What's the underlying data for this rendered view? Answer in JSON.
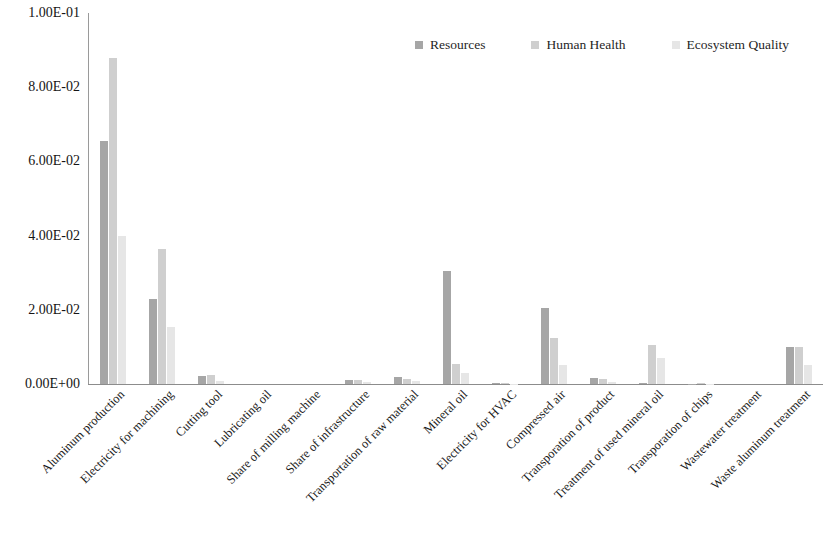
{
  "chart_data": {
    "type": "bar",
    "title": "",
    "subtitle": "",
    "xlabel": "",
    "ylabel": "",
    "ylim": [
      0,
      0.1
    ],
    "grid": false,
    "legend_position": "top-right",
    "orientation": "vertical-grouped",
    "ytick_labels": [
      "1.00E-01",
      "8.00E-02",
      "6.00E-02",
      "4.00E-02",
      "2.00E-02",
      "0.00E+00"
    ],
    "ytick_values": [
      0.1,
      0.08,
      0.06,
      0.04,
      0.02,
      0
    ],
    "categories": [
      "Aluminum production",
      "Electricity for machining",
      "Cutting tool",
      "Lubricating oil",
      "Share of milling machine",
      "Share of infrastructure",
      "Transportation of raw material",
      "Mineral oil",
      "Electricity for HVAC",
      "Compressed air",
      "Transporation of product",
      "Treatment of used mineral oil",
      "Transporation of chips",
      "Wastewater treatment",
      "Waste aluminum treatment"
    ],
    "series": [
      {
        "name": "Resources",
        "color": "#a6a6a6",
        "values": [
          0.0655,
          0.023,
          0.0022,
          0.0,
          0.0,
          0.0011,
          0.0019,
          0.0305,
          0.0002,
          0.0205,
          0.0017,
          0.0002,
          0.0001,
          0.0,
          0.01
        ]
      },
      {
        "name": "Human Health",
        "color": "#cfcfcf",
        "values": [
          0.088,
          0.0365,
          0.0025,
          0.0,
          0.0,
          0.001,
          0.0013,
          0.0055,
          0.0002,
          0.0125,
          0.0013,
          0.0105,
          0.0002,
          0.0,
          0.01
        ]
      },
      {
        "name": "Ecosystem Quality",
        "color": "#e6e6e6",
        "values": [
          0.04,
          0.0155,
          0.0009,
          0.0,
          0.0,
          0.0005,
          0.0007,
          0.003,
          0.0001,
          0.005,
          0.0006,
          0.007,
          0.0001,
          0.0,
          0.005
        ]
      }
    ]
  }
}
